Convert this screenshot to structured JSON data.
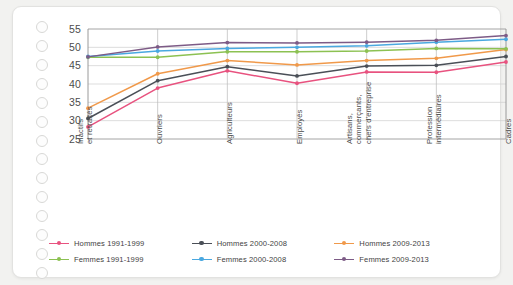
{
  "chart_data": {
    "type": "line",
    "title": "",
    "subtitle": "",
    "xlabel": "",
    "ylabel": "",
    "ylim": [
      25,
      55
    ],
    "yticks": [
      25,
      30,
      35,
      40,
      45,
      50,
      55
    ],
    "grid": true,
    "legend_position": "bottom",
    "categories": [
      "Inactifs\net retraités",
      "Ouvriers",
      "Agriculteurs",
      "Employés",
      "Artisans,\ncommerçants,\nchefs d'entreprise",
      "Profession\nintermédiaires",
      "Cadres"
    ],
    "series": [
      {
        "name": "Hommes 1991-1999",
        "color": "#e8527f",
        "values": [
          28.3,
          38.9,
          43.6,
          40.2,
          43.3,
          43.2,
          46.0
        ]
      },
      {
        "name": "Hommes 2000-2008",
        "color": "#4a4f57",
        "values": [
          30.6,
          40.9,
          44.7,
          42.2,
          44.9,
          45.1,
          47.5
        ]
      },
      {
        "name": "Hommes 2009-2013",
        "color": "#f0994a",
        "values": [
          33.4,
          42.8,
          46.4,
          45.2,
          46.4,
          47.0,
          49.4
        ]
      },
      {
        "name": "Femmes 1991-1999",
        "color": "#8cc152",
        "values": [
          47.3,
          47.3,
          48.8,
          48.8,
          49.0,
          49.7,
          49.6
        ]
      },
      {
        "name": "Femmes 2000-2008",
        "color": "#4aa8e0",
        "values": [
          47.5,
          49.0,
          49.7,
          50.0,
          50.4,
          51.4,
          52.2
        ]
      },
      {
        "name": "Femmes 2009-2013",
        "color": "#7d5b86",
        "values": [
          47.4,
          50.1,
          51.3,
          51.2,
          51.4,
          51.9,
          53.2
        ]
      }
    ]
  },
  "legend": {
    "items": [
      {
        "label": "Hommes 1991-1999",
        "color": "#e8527f"
      },
      {
        "label": "Hommes 2000-2008",
        "color": "#4a4f57"
      },
      {
        "label": "Hommes 2009-2013",
        "color": "#f0994a"
      },
      {
        "label": "Femmes 1991-1999",
        "color": "#8cc152"
      },
      {
        "label": "Femmes 2000-2008",
        "color": "#4aa8e0"
      },
      {
        "label": "Femmes 2009-2013",
        "color": "#7d5b86"
      }
    ]
  },
  "page": {
    "punch_hole_count": 14,
    "background_color": "#f2f2f0",
    "card_color": "#ffffff"
  }
}
